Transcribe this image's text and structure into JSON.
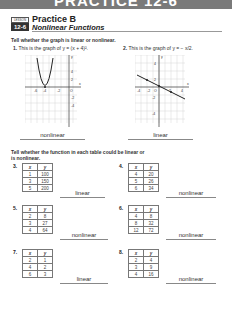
{
  "banner": {
    "text": "PRACTICE 12-6"
  },
  "header": {
    "lesson_label": "LESSON",
    "lesson_number": "12-6",
    "title": "Practice B",
    "subtitle": "Nonlinear Functions"
  },
  "section1": {
    "instruction": "Tell whether the graph is linear or nonlinear.",
    "problems": [
      {
        "number": "1.",
        "text": "This is the graph of y = (x + 4)².",
        "answer": "nonlinear",
        "graph": {
          "type": "parabola",
          "x_ticks": [
            "-6",
            "-4",
            "-2",
            "O"
          ],
          "y_ticks": [
            "4",
            "2",
            "-2",
            "-4"
          ]
        }
      },
      {
        "number": "2.",
        "text": "This is the graph of y = − x/2.",
        "answer": "linear",
        "graph": {
          "type": "line",
          "x_ticks": [
            "-4",
            "-2",
            "O",
            "2",
            "4"
          ],
          "y_ticks": [
            "4",
            "2",
            "-2",
            "-4"
          ]
        }
      }
    ]
  },
  "section2": {
    "instruction_line1": "Tell whether the function in each table could be linear or",
    "instruction_line2": "is nonlinear.",
    "headers": {
      "x": "x",
      "y": "y"
    },
    "problems": [
      {
        "number": "3.",
        "rows": [
          [
            "1",
            "100"
          ],
          [
            "3",
            "150"
          ],
          [
            "5",
            "200"
          ]
        ],
        "answer": "linear"
      },
      {
        "number": "4.",
        "rows": [
          [
            "4",
            "20"
          ],
          [
            "5",
            "26"
          ],
          [
            "6",
            "34"
          ]
        ],
        "answer": "nonlinear"
      },
      {
        "number": "5.",
        "rows": [
          [
            "2",
            "8"
          ],
          [
            "3",
            "27"
          ],
          [
            "4",
            "64"
          ]
        ],
        "answer": "nonlinear"
      },
      {
        "number": "6.",
        "rows": [
          [
            "4",
            "8"
          ],
          [
            "8",
            "32"
          ],
          [
            "12",
            "72"
          ]
        ],
        "answer": "nonlinear"
      },
      {
        "number": "7.",
        "rows": [
          [
            "2",
            "1"
          ],
          [
            "4",
            "2"
          ],
          [
            "6",
            "3"
          ]
        ],
        "answer": "linear"
      },
      {
        "number": "8.",
        "rows": [
          [
            "2",
            "4"
          ],
          [
            "3",
            "9"
          ],
          [
            "4",
            "16"
          ]
        ],
        "answer": "nonlinear"
      }
    ]
  }
}
